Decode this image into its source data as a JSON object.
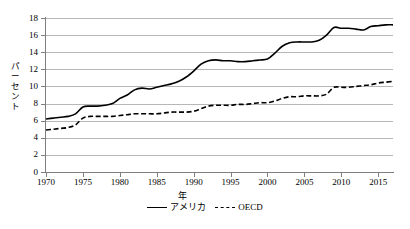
{
  "chart_data": {
    "type": "line",
    "title": "",
    "xlabel": "年",
    "ylabel": "パーセント",
    "xlim": [
      1970,
      2017
    ],
    "ylim": [
      0,
      18
    ],
    "ytick_step": 2,
    "grid": true,
    "legend_position": "bottom-center",
    "xticks": [
      "1970",
      "1975",
      "1980",
      "1985",
      "1990",
      "1995",
      "2000",
      "2005",
      "2010",
      "2015"
    ],
    "yticks": [
      "0",
      "2",
      "4",
      "6",
      "8",
      "10",
      "12",
      "14",
      "16",
      "18"
    ],
    "x": [
      1970,
      1971,
      1972,
      1973,
      1974,
      1975,
      1976,
      1977,
      1978,
      1979,
      1980,
      1981,
      1982,
      1983,
      1984,
      1985,
      1986,
      1987,
      1988,
      1989,
      1990,
      1991,
      1992,
      1993,
      1994,
      1995,
      1996,
      1997,
      1998,
      1999,
      2000,
      2001,
      2002,
      2003,
      2004,
      2005,
      2006,
      2007,
      2008,
      2009,
      2010,
      2011,
      2012,
      2013,
      2014,
      2015,
      2016,
      2017
    ],
    "series": [
      {
        "name": "アメリカ",
        "style": "solid",
        "color": "#000000",
        "values": [
          6.2,
          6.3,
          6.4,
          6.5,
          6.8,
          7.6,
          7.7,
          7.7,
          7.8,
          8.0,
          8.6,
          9.0,
          9.6,
          9.8,
          9.7,
          9.9,
          10.1,
          10.3,
          10.6,
          11.1,
          11.8,
          12.6,
          13.0,
          13.1,
          13.0,
          13.0,
          12.9,
          12.9,
          13.0,
          13.1,
          13.2,
          13.9,
          14.7,
          15.1,
          15.2,
          15.2,
          15.2,
          15.4,
          16.0,
          16.9,
          16.8,
          16.8,
          16.7,
          16.6,
          17.0,
          17.1,
          17.2,
          17.2
        ]
      },
      {
        "name": "OECD",
        "style": "dashed",
        "color": "#000000",
        "values": [
          4.9,
          5.0,
          5.1,
          5.2,
          5.5,
          6.3,
          6.5,
          6.5,
          6.5,
          6.5,
          6.6,
          6.7,
          6.8,
          6.8,
          6.8,
          6.8,
          6.9,
          7.0,
          7.0,
          7.0,
          7.1,
          7.4,
          7.7,
          7.8,
          7.8,
          7.8,
          7.9,
          7.9,
          8.0,
          8.1,
          8.1,
          8.3,
          8.6,
          8.8,
          8.8,
          8.9,
          8.9,
          8.9,
          9.1,
          9.9,
          9.9,
          9.9,
          10.0,
          10.1,
          10.2,
          10.4,
          10.5,
          10.6
        ]
      }
    ]
  },
  "legend": {
    "items": [
      {
        "label": "アメリカ",
        "style": "solid"
      },
      {
        "label": "OECD",
        "style": "dashed"
      }
    ]
  },
  "caption": ""
}
